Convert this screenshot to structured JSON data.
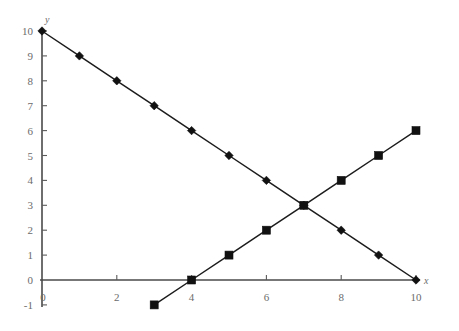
{
  "chart_data": {
    "type": "line",
    "title": "",
    "subtitle": "",
    "xlabel": "x",
    "ylabel": "y",
    "xlim": [
      0,
      10
    ],
    "ylim": [
      -1,
      10
    ],
    "grid": false,
    "legend": "none",
    "x_ticks": [
      0,
      2,
      4,
      6,
      8,
      10
    ],
    "x_tick_labels": [
      "0",
      "2",
      "4",
      "6",
      "8",
      "10"
    ],
    "x_minor_ticks": [
      1,
      3,
      5,
      7,
      9
    ],
    "y_ticks": [
      -1,
      0,
      1,
      2,
      3,
      4,
      5,
      6,
      7,
      8,
      9,
      10
    ],
    "y_tick_labels": [
      "-1",
      "0",
      "1",
      "2",
      "3",
      "4",
      "5",
      "6",
      "7",
      "8",
      "9",
      "10"
    ],
    "series": [
      {
        "name": "descending-line",
        "marker": "diamond",
        "color": "#111111",
        "x": [
          0,
          1,
          2,
          3,
          4,
          5,
          6,
          7,
          8,
          9,
          10
        ],
        "values": [
          10,
          9,
          8,
          7,
          6,
          5,
          4,
          3,
          2,
          1,
          0
        ]
      },
      {
        "name": "ascending-line",
        "marker": "square",
        "color": "#111111",
        "x": [
          3,
          4,
          5,
          6,
          7,
          8,
          9,
          10
        ],
        "values": [
          -1,
          0,
          1,
          2,
          3,
          4,
          5,
          6
        ]
      }
    ],
    "intersection": {
      "x": 7,
      "y": 3
    }
  },
  "axes": {
    "x_axis_name": "x",
    "y_axis_name": "y"
  }
}
